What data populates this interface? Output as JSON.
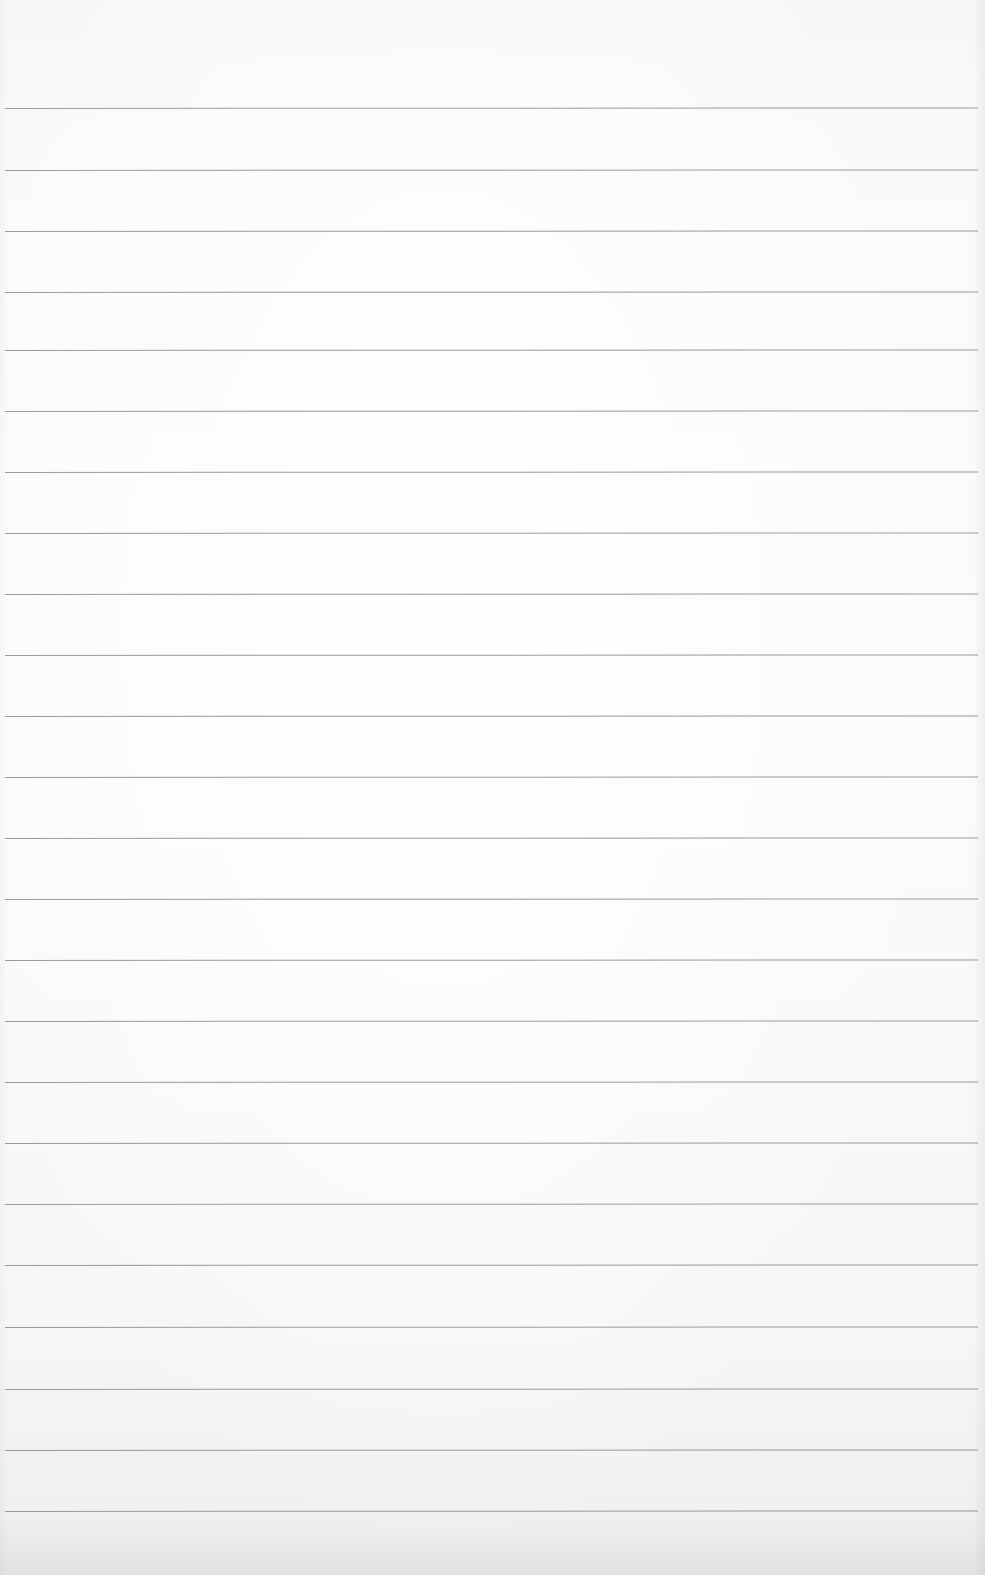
{
  "page": {
    "type": "blank-lined-paper",
    "width": 985,
    "height": 1575,
    "background_color": "#f8f8f8",
    "rule_color": "#8a8a8a"
  },
  "rules": {
    "count": 24,
    "left_x": 5,
    "right_x": 978,
    "y_positions": [
      108,
      170,
      231,
      292,
      350,
      411,
      472,
      533,
      594,
      655,
      716,
      777,
      838,
      899,
      960,
      1021,
      1082,
      1143,
      1204,
      1265,
      1327,
      1389,
      1450,
      1511
    ]
  }
}
